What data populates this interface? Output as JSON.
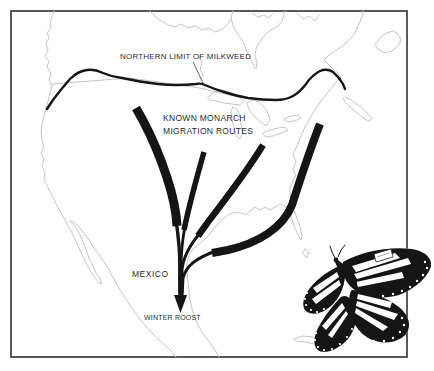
{
  "figure": {
    "colors": {
      "ink": "#151515",
      "map_outline": "#c6c6c6",
      "frame": "#474747",
      "background": "#ffffff",
      "label_text": "#2b2b2b"
    }
  },
  "labels": {
    "northern_limit": "NORTHERN LIMIT OF MILKWEED",
    "routes_line1": "KNOWN MONARCH",
    "routes_line2": "MIGRATION ROUTES",
    "mexico": "MEXICO",
    "winter_roost": "WINTER ROOST"
  },
  "icons": {
    "butterfly": "monarch-butterfly-illustration",
    "arrow": "winter-roost-arrowhead"
  }
}
